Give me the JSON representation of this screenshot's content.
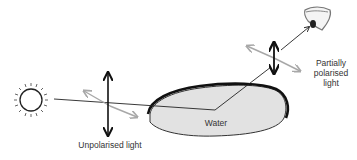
{
  "diagram": {
    "title": "",
    "labels": {
      "unpolarised": "Unpolarised light",
      "water": "Water",
      "partial_line1": "Partially",
      "partial_line2": "polarised",
      "partial_line3": "light"
    },
    "elements": {
      "sun": "sun-icon",
      "eye": "eye-icon",
      "water_body": "water-pond"
    },
    "colors": {
      "water_fill": "#e2e2e2",
      "water_outline": "#111111",
      "ray": "#222222",
      "vertical_arrow": "#111111",
      "horizontal_arrow": "#a8a8a8"
    }
  }
}
